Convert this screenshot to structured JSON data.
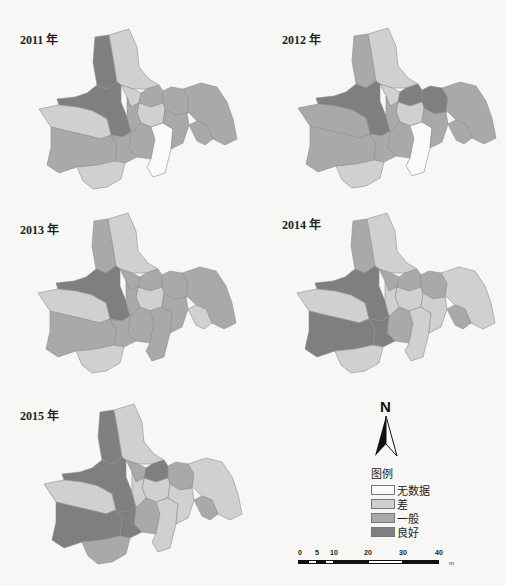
{
  "maps": [
    {
      "year_label": "2011 年",
      "classes": {
        "r1": "good",
        "r2": "poor",
        "r3": "good",
        "r4": "poor",
        "r5": "fair",
        "r6": "fair",
        "r7": "fair",
        "r8": "poor",
        "r9": "fair",
        "r10": "poor",
        "r11": "fair",
        "r12": "fair",
        "r13": "nodata",
        "r14": "fair",
        "r15": "fair",
        "r16": "poor",
        "r17": "fair"
      }
    },
    {
      "year_label": "2012 年",
      "classes": {
        "r1": "fair",
        "r2": "poor",
        "r3": "good",
        "r4": "poor",
        "r5": "good",
        "r6": "good",
        "r7": "fair",
        "r8": "poor",
        "r9": "fair",
        "r10": "fair",
        "r11": "fair",
        "r12": "fair",
        "r13": "nodata",
        "r14": "fair",
        "r15": "fair",
        "r16": "poor",
        "r17": "fair"
      }
    },
    {
      "year_label": "2013 年",
      "classes": {
        "r1": "fair",
        "r2": "poor",
        "r3": "good",
        "r4": "fair",
        "r5": "fair",
        "r6": "fair",
        "r7": "fair",
        "r8": "poor",
        "r9": "fair",
        "r10": "poor",
        "r11": "fair",
        "r12": "fair",
        "r13": "fair",
        "r14": "fair",
        "r15": "fair",
        "r16": "poor",
        "r17": "poor"
      }
    },
    {
      "year_label": "2014 年",
      "classes": {
        "r1": "fair",
        "r2": "poor",
        "r3": "good",
        "r4": "fair",
        "r5": "fair",
        "r6": "fair",
        "r7": "poor",
        "r8": "poor",
        "r9": "poor",
        "r10": "poor",
        "r11": "good",
        "r12": "fair",
        "r13": "poor",
        "r14": "poor",
        "r15": "good",
        "r16": "poor",
        "r17": "fair"
      }
    },
    {
      "year_label": "2015 年",
      "classes": {
        "r1": "good",
        "r2": "poor",
        "r3": "good",
        "r4": "fair",
        "r5": "good",
        "r6": "fair",
        "r7": "poor",
        "r8": "poor",
        "r9": "poor",
        "r10": "poor",
        "r11": "good",
        "r12": "fair",
        "r13": "poor",
        "r14": "poor",
        "r15": "good",
        "r16": "fair",
        "r17": "fair"
      }
    }
  ],
  "compass": {
    "label": "N"
  },
  "legend": {
    "title": "图例",
    "items": [
      {
        "key": "nodata",
        "label": "无数据",
        "color": "#fafafa"
      },
      {
        "key": "poor",
        "label": "差",
        "color": "#d0d0d0"
      },
      {
        "key": "fair",
        "label": "一般",
        "color": "#a9a9a9"
      },
      {
        "key": "good",
        "label": "良好",
        "color": "#7f7f7f"
      }
    ]
  },
  "scale_bar": {
    "ticks": [
      "0",
      "5",
      "10",
      "20",
      "30",
      "40"
    ],
    "unit": "m"
  }
}
